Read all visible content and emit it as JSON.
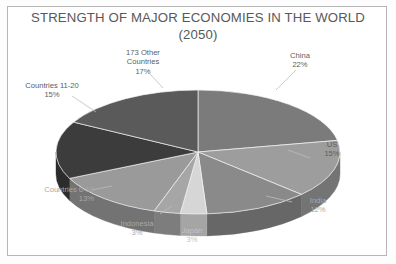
{
  "chart_data": {
    "type": "pie",
    "title": "STRENGTH OF MAJOR ECONOMIES IN THE WORLD\n(2050)",
    "title_line1": "STRENGTH OF MAJOR ECONOMIES IN THE WORLD",
    "title_line2": "(2050)",
    "three_d": true,
    "legend": "none",
    "value_unit": "percent",
    "categories": [
      "China",
      "US",
      "India",
      "Japan",
      "Indonesia",
      "Countries 6-10",
      "Countries 11-20",
      "173 Other Countries"
    ],
    "values": [
      22,
      15,
      12,
      3,
      3,
      13,
      15,
      17
    ],
    "total": 100,
    "slices": [
      {
        "name": "China",
        "value": 22,
        "label": "China",
        "percent_label": "22%",
        "color": "#7b7b7b",
        "side_color": "#5e5e5e"
      },
      {
        "name": "US",
        "value": 15,
        "label": "US",
        "percent_label": "15%",
        "color": "#9d9d9d",
        "side_color": "#747474"
      },
      {
        "name": "India",
        "value": 12,
        "label": "India",
        "percent_label": "12%",
        "color": "#8a8a8a",
        "side_color": "#676767"
      },
      {
        "name": "Japan",
        "value": 3,
        "label": "Japan",
        "percent_label": "3%",
        "color": "#d6d6d6",
        "side_color": "#a5a5a5"
      },
      {
        "name": "Indonesia",
        "value": 3,
        "label": "Indonesia",
        "percent_label": "3%",
        "color": "#a6a6a6",
        "side_color": "#7d7d7d"
      },
      {
        "name": "Countries 6-10",
        "value": 13,
        "label": "Countries 6-10",
        "percent_label": "13%",
        "color": "#9a9a9a",
        "side_color": "#737373"
      },
      {
        "name": "Countries 11-20",
        "value": 15,
        "label": "Countries 11-20",
        "percent_label": "15%",
        "color": "#3c3c3c",
        "side_color": "#2c2c2c"
      },
      {
        "name": "173 Other Countries",
        "value": 17,
        "label": "173 Other\nCountries",
        "percent_label": "17%",
        "color": "#5a5a5a",
        "side_color": "#444444"
      }
    ],
    "labels": {
      "other_countries": "173 Other\nCountries\n17%",
      "countries_11_20": "Countries 11-20\n15%",
      "countries_6_10": "Countries 6-10\n13%",
      "indonesia": "Indonesia\n3%",
      "japan": "Japan\n3%",
      "china": "China\n22%",
      "us": "US\n15%",
      "india": "India\n12%"
    },
    "colors": {
      "background": "#ffffff",
      "frame_border": "#b6b6b6",
      "title_text": "#585858",
      "label_text": "#5d5d5d",
      "leader_line": "#bdbdbd"
    }
  }
}
